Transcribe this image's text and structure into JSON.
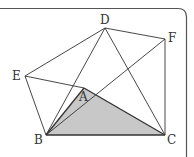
{
  "figure": {
    "type": "geometry",
    "points": {
      "A": {
        "x": 84,
        "y": 88
      },
      "B": {
        "x": 46,
        "y": 135
      },
      "C": {
        "x": 165,
        "y": 135
      },
      "D": {
        "x": 105,
        "y": 28
      },
      "E": {
        "x": 25,
        "y": 76
      },
      "F": {
        "x": 165,
        "y": 39
      }
    },
    "labels": {
      "A": "A",
      "B": "B",
      "C": "C",
      "D": "D",
      "E": "E",
      "F": "F"
    },
    "segments": [
      [
        "E",
        "D"
      ],
      [
        "D",
        "F"
      ],
      [
        "F",
        "C"
      ],
      [
        "E",
        "B"
      ],
      [
        "E",
        "A"
      ],
      [
        "B",
        "D"
      ],
      [
        "B",
        "F"
      ],
      [
        "D",
        "C"
      ],
      [
        "A",
        "B"
      ],
      [
        "A",
        "C"
      ],
      [
        "B",
        "C"
      ]
    ],
    "shaded_region": [
      "A",
      "B",
      "C"
    ],
    "colors": {
      "line": "#333333",
      "shade": "#c8c8c8",
      "frame": "#555555"
    }
  }
}
